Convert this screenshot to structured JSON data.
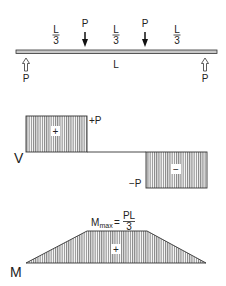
{
  "beam": {
    "load_label_left": "P",
    "load_label_right": "P",
    "reaction_label_left": "P",
    "reaction_label_right": "P",
    "span_label": "L",
    "segment_labels": [
      {
        "num": "L",
        "den": "3"
      },
      {
        "num": "L",
        "den": "3"
      },
      {
        "num": "L",
        "den": "3"
      }
    ]
  },
  "shear": {
    "axis_label": "V",
    "positive_value_label": "+P",
    "negative_value_label": "−P",
    "positive_sign": "+",
    "negative_sign": "−"
  },
  "moment": {
    "axis_label": "M",
    "max_label_main": "M",
    "max_label_sub": "max",
    "max_label_eq": "=",
    "max_label_num": "PL",
    "max_label_den": "3",
    "sign": "+"
  },
  "colors": {
    "ink": "#222222",
    "beam_fill": "#c8c8c8",
    "hatch": "#555555"
  }
}
